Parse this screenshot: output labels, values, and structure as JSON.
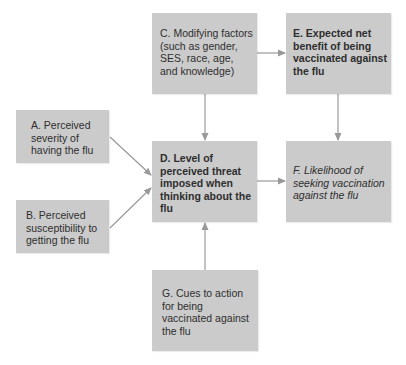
{
  "diagram": {
    "type": "flowchart",
    "colors": {
      "box_fill": "#cbcbcb",
      "text": "#2e2e2e",
      "arrow": "#999999",
      "background": "#ffffff"
    },
    "nodes": {
      "a": {
        "id": "A",
        "label": "A. Perceived\nseverity of\nhaving the flu",
        "style": "normal"
      },
      "b": {
        "id": "B",
        "label": "B. Perceived\nsusceptibility to\ngetting the flu",
        "style": "normal"
      },
      "c": {
        "id": "C",
        "label": "C. Modifying factors\n(such as gender,\nSES, race, age,\nand knowledge)",
        "style": "normal"
      },
      "d": {
        "id": "D",
        "label": "D. Level of\nperceived threat\nimposed when\nthinking about the\nflu",
        "style": "bold"
      },
      "e": {
        "id": "E",
        "label": "E. Expected net\nbenefit of being\nvaccinated against\nthe flu",
        "style": "bold"
      },
      "f": {
        "id": "F",
        "label": "F. Likelihood of\nseeking vaccination\nagainst the flu",
        "style": "italic"
      },
      "g": {
        "id": "G",
        "label": "G. Cues to action\nfor being\nvaccinated against\nthe flu",
        "style": "normal"
      }
    },
    "edges": [
      {
        "from": "A",
        "to": "D"
      },
      {
        "from": "B",
        "to": "D"
      },
      {
        "from": "C",
        "to": "D"
      },
      {
        "from": "C",
        "to": "E"
      },
      {
        "from": "D",
        "to": "F"
      },
      {
        "from": "E",
        "to": "F"
      },
      {
        "from": "G",
        "to": "D"
      }
    ]
  }
}
